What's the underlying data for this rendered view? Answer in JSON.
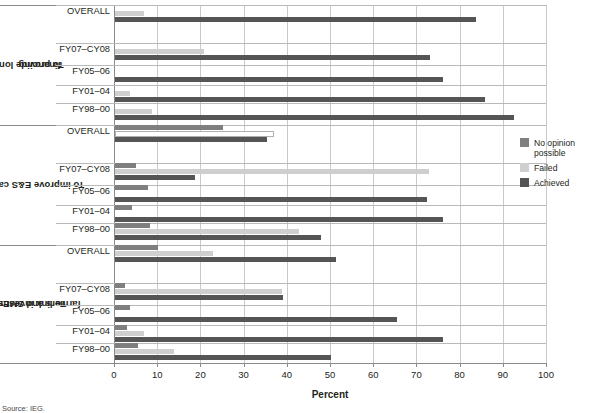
{
  "chart_data": {
    "type": "bar",
    "orientation": "horizontal",
    "title": "",
    "xlabel": "Percent",
    "ylabel": "",
    "xlim": [
      0,
      100
    ],
    "xticks": [
      0,
      10,
      20,
      30,
      40,
      50,
      60,
      70,
      80,
      90,
      100
    ],
    "grid": "vertical",
    "legend_position": "right",
    "legend": [
      "No opinion possible",
      "Failed",
      "Achieved"
    ],
    "series_colors": {
      "No opinion possible": "#7f7f7f",
      "Failed": "#cfcfcf",
      "Achieved": "#555555"
    },
    "groups": [
      {
        "name": "To provide long-term financing",
        "categories": [
          "OVERALL",
          "FY07–CY08",
          "FY05–06",
          "FY01–04",
          "FY98–00"
        ],
        "series": [
          {
            "name": "No opinion possible",
            "values": [
              0,
              0,
              0,
              0,
              0
            ]
          },
          {
            "name": "Failed",
            "values": [
              6.6,
              20.5,
              0,
              3.5,
              8.6
            ]
          },
          {
            "name": "Achieved",
            "values": [
              83.5,
              73.0,
              76.0,
              85.7,
              92.4
            ]
          }
        ]
      },
      {
        "name": "To improve E&S capacity",
        "categories": [
          "OVERALL",
          "FY07–CY08",
          "FY05–06",
          "FY01–04",
          "FY98–00"
        ],
        "series": [
          {
            "name": "No opinion possible",
            "values": [
              25.1,
              4.9,
              7.6,
              3.9,
              8.2
            ]
          },
          {
            "name": "Failed",
            "values": [
              36.8,
              72.8,
              0,
              0,
              42.7
            ]
          },
          {
            "name": "Achieved",
            "values": [
              35.1,
              18.5,
              72.3,
              75.9,
              47.7
            ]
          }
        ]
      },
      {
        "name": "To link investments to farmers and SMEs",
        "categories": [
          "OVERALL",
          "FY07–CY08",
          "FY05–06",
          "FY01–04",
          "FY98–00"
        ],
        "series": [
          {
            "name": "No opinion possible",
            "values": [
              9.9,
              2.3,
              3.5,
              2.8,
              5.4
            ]
          },
          {
            "name": "Failed",
            "values": [
              22.6,
              38.7,
              0,
              6.8,
              13.7
            ]
          },
          {
            "name": "Achieved",
            "values": [
              51.2,
              38.8,
              65.3,
              76.0,
              50.0
            ]
          }
        ]
      }
    ]
  },
  "axis": {
    "title": "Percent",
    "tick_labels": [
      "0",
      "10",
      "20",
      "30",
      "40",
      "50",
      "60",
      "70",
      "80",
      "90",
      "100"
    ]
  },
  "groups": {
    "g0": {
      "title": "To provide long-term financing",
      "title_line1": "To provide long-term",
      "title_line2": "financing",
      "rows": [
        "OVERALL",
        "FY07–CY08",
        "FY05–06",
        "FY01–04",
        "FY98–00"
      ]
    },
    "g1": {
      "title": "To improve E&S capacity",
      "title_line1": "To improve E&S capacity",
      "title_line2": "",
      "rows": [
        "OVERALL",
        "FY07–CY08",
        "FY05–06",
        "FY01–04",
        "FY98–00"
      ]
    },
    "g2": {
      "title": "To link investments to farmers and SMEs",
      "title_line1": "To link investments to",
      "title_line2": "farmers and SMEs",
      "rows": [
        "OVERALL",
        "FY07–CY08",
        "FY05–06",
        "FY01–04",
        "FY98–00"
      ]
    }
  },
  "legend": {
    "items": [
      {
        "label": "No opinion possible",
        "color": "#7f7f7f"
      },
      {
        "label": "Failed",
        "color": "#cfcfcf"
      },
      {
        "label": "Achieved",
        "color": "#555555"
      }
    ]
  },
  "source": {
    "text": "Source: IEG."
  }
}
